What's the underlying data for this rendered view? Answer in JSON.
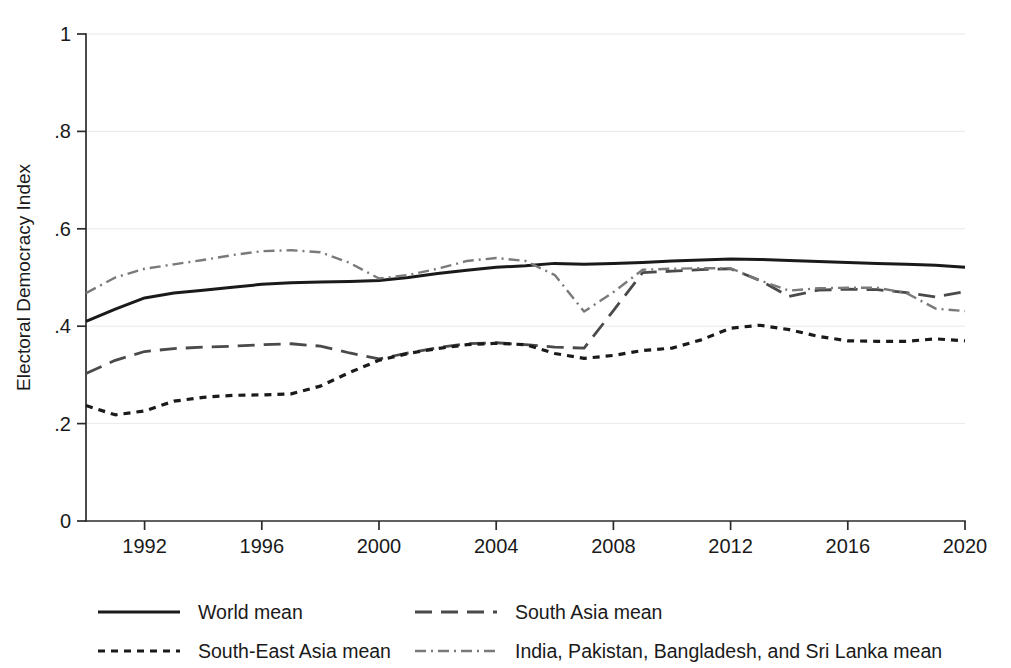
{
  "chart_data": {
    "type": "line",
    "title": "",
    "xlabel": "",
    "ylabel": "Electoral Democracy Index",
    "xlim": [
      1990,
      2020
    ],
    "ylim": [
      0,
      1
    ],
    "grid": true,
    "legend_position": "bottom",
    "x_ticks": [
      "1992",
      "1996",
      "2000",
      "2004",
      "2008",
      "2012",
      "2016",
      "2020"
    ],
    "x_tick_values": [
      1992,
      1996,
      2000,
      2004,
      2008,
      2012,
      2016,
      2020
    ],
    "y_ticks": [
      "0",
      ".2",
      ".4",
      ".6",
      ".8",
      "1"
    ],
    "y_tick_values": [
      0,
      0.2,
      0.4,
      0.6,
      0.8,
      1
    ],
    "x": [
      1990,
      1991,
      1992,
      1993,
      1994,
      1995,
      1996,
      1997,
      1998,
      1999,
      2000,
      2001,
      2002,
      2003,
      2004,
      2005,
      2006,
      2007,
      2008,
      2009,
      2010,
      2011,
      2012,
      2013,
      2014,
      2015,
      2016,
      2017,
      2018,
      2019,
      2020
    ],
    "series": [
      {
        "name": "World mean",
        "style": "solid",
        "color": "#1a1a1a",
        "values": [
          0.41,
          0.435,
          0.458,
          0.468,
          0.474,
          0.48,
          0.486,
          0.489,
          0.491,
          0.492,
          0.494,
          0.5,
          0.508,
          0.515,
          0.521,
          0.524,
          0.529,
          0.527,
          0.529,
          0.531,
          0.534,
          0.536,
          0.538,
          0.537,
          0.535,
          0.533,
          0.531,
          0.529,
          0.527,
          0.525,
          0.521
        ]
      },
      {
        "name": "South Asia mean",
        "style": "long-dash",
        "color": "#4a4a4a",
        "values": [
          0.303,
          0.33,
          0.348,
          0.354,
          0.357,
          0.359,
          0.362,
          0.364,
          0.359,
          0.345,
          0.333,
          0.345,
          0.356,
          0.364,
          0.366,
          0.362,
          0.357,
          0.355,
          0.432,
          0.51,
          0.513,
          0.516,
          0.518,
          0.494,
          0.461,
          0.474,
          0.476,
          0.475,
          0.469,
          0.46,
          0.471
        ]
      },
      {
        "name": "South-East Asia mean",
        "style": "short-dash",
        "color": "#1a1a1a",
        "values": [
          0.237,
          0.218,
          0.226,
          0.246,
          0.254,
          0.258,
          0.259,
          0.261,
          0.277,
          0.305,
          0.33,
          0.344,
          0.354,
          0.362,
          0.365,
          0.362,
          0.344,
          0.334,
          0.34,
          0.35,
          0.355,
          0.372,
          0.396,
          0.402,
          0.393,
          0.379,
          0.37,
          0.369,
          0.369,
          0.374,
          0.37
        ]
      },
      {
        "name": "India, Pakistan, Bangladesh, and Sri Lanka mean",
        "style": "dash-dot",
        "color": "#7a7a7a",
        "values": [
          0.468,
          0.5,
          0.518,
          0.527,
          0.536,
          0.546,
          0.554,
          0.556,
          0.552,
          0.53,
          0.498,
          0.505,
          0.518,
          0.534,
          0.54,
          0.534,
          0.505,
          0.43,
          0.47,
          0.516,
          0.518,
          0.519,
          0.519,
          0.494,
          0.473,
          0.478,
          0.479,
          0.479,
          0.468,
          0.436,
          0.431
        ]
      }
    ]
  },
  "legend": {
    "entries": [
      {
        "label": "World mean",
        "style": "solid"
      },
      {
        "label": "South Asia mean",
        "style": "long-dash"
      },
      {
        "label": "South-East Asia mean",
        "style": "short-dash"
      },
      {
        "label": "India, Pakistan, Bangladesh, and Sri Lanka mean",
        "style": "dash-dot"
      }
    ]
  }
}
